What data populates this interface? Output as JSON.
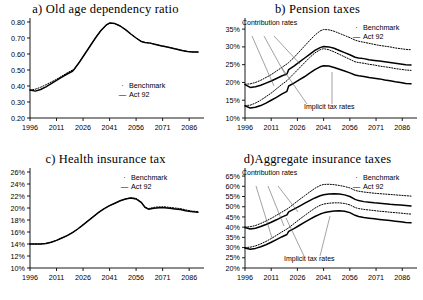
{
  "figure": {
    "panels": [
      {
        "key": "a",
        "title": "a) Old age dependency ratio",
        "legend": [
          {
            "marker": "·",
            "label": "Benchmark"
          },
          {
            "marker": "—",
            "label": "Act 92"
          }
        ],
        "annotations": [],
        "chart_data": {
          "type": "line",
          "title": "a) Old age dependency ratio",
          "xlabel": "",
          "ylabel": "",
          "xlim": [
            1996,
            2091
          ],
          "ylim": [
            0.2,
            0.8
          ],
          "yticks": [
            "0.20",
            "0.30",
            "0.40",
            "0.50",
            "0.60",
            "0.70",
            "0.80"
          ],
          "xticks": [
            "1996",
            "2011",
            "2026",
            "2041",
            "2056",
            "2071",
            "2086"
          ],
          "grid": false,
          "legend_position": "inside-right",
          "x": [
            1996,
            1999,
            2002,
            2005,
            2008,
            2011,
            2014,
            2017,
            2020,
            2021,
            2024,
            2027,
            2030,
            2033,
            2036,
            2039,
            2041,
            2044,
            2047,
            2050,
            2053,
            2056,
            2059,
            2061,
            2064,
            2067,
            2070,
            2073,
            2076,
            2079,
            2082,
            2085,
            2088,
            2091
          ],
          "series": [
            {
              "name": "Benchmark",
              "style": "dotted",
              "values": [
                0.375,
                0.38,
                0.392,
                0.408,
                0.425,
                0.442,
                0.462,
                0.482,
                0.5,
                0.505,
                0.55,
                0.6,
                0.65,
                0.7,
                0.745,
                0.78,
                0.793,
                0.79,
                0.775,
                0.752,
                0.725,
                0.7,
                0.678,
                0.672,
                0.668,
                0.66,
                0.652,
                0.645,
                0.638,
                0.63,
                0.622,
                0.616,
                0.613,
                0.612
              ]
            },
            {
              "name": "Act 92",
              "style": "solid",
              "values": [
                0.375,
                0.368,
                0.378,
                0.395,
                0.415,
                0.435,
                0.455,
                0.475,
                0.492,
                0.505,
                0.55,
                0.6,
                0.65,
                0.7,
                0.745,
                0.78,
                0.793,
                0.79,
                0.775,
                0.752,
                0.725,
                0.7,
                0.678,
                0.672,
                0.668,
                0.66,
                0.652,
                0.645,
                0.638,
                0.63,
                0.622,
                0.616,
                0.613,
                0.612
              ]
            }
          ]
        }
      },
      {
        "key": "b",
        "title": "b) Pension taxes",
        "legend": [
          {
            "marker": "·",
            "label": "Benchmark"
          },
          {
            "marker": "—",
            "label": "Act 92"
          }
        ],
        "annotations": [
          "Contribution rates",
          "Implicit tax rates"
        ],
        "chart_data": {
          "type": "line",
          "title": "b) Pension taxes",
          "xlabel": "",
          "ylabel": "",
          "xlim": [
            1996,
            2091
          ],
          "ylim": [
            10,
            37
          ],
          "yticks": [
            "10%",
            "15%",
            "20%",
            "25%",
            "30%",
            "35%"
          ],
          "xticks": [
            "1996",
            "2011",
            "2026",
            "2041",
            "2056",
            "2071",
            "2086"
          ],
          "grid": false,
          "legend_position": "top-right",
          "x": [
            1996,
            1999,
            2002,
            2005,
            2008,
            2011,
            2014,
            2017,
            2020,
            2021,
            2024,
            2027,
            2030,
            2033,
            2036,
            2039,
            2041,
            2044,
            2047,
            2050,
            2053,
            2056,
            2059,
            2061,
            2064,
            2067,
            2070,
            2073,
            2076,
            2079,
            2082,
            2085,
            2088,
            2091
          ],
          "series": [
            {
              "name": "Contribution rates - Benchmark",
              "style": "dotted",
              "group": "contribution",
              "values": [
                19.5,
                19.6,
                20.0,
                20.6,
                21.4,
                22.2,
                23.2,
                24.2,
                25.2,
                25.6,
                27.0,
                28.6,
                30.2,
                31.8,
                33.3,
                34.5,
                34.9,
                34.8,
                34.4,
                33.8,
                33.2,
                32.6,
                31.9,
                31.6,
                31.3,
                31.0,
                30.7,
                30.4,
                30.2,
                30.0,
                29.7,
                29.5,
                29.3,
                29.2
              ]
            },
            {
              "name": "Contribution rates - Act 92",
              "style": "solid",
              "group": "contribution",
              "values": [
                19.4,
                18.6,
                18.8,
                19.2,
                19.8,
                20.4,
                21.1,
                21.8,
                22.4,
                23.6,
                24.6,
                25.7,
                26.8,
                27.9,
                29.0,
                29.8,
                30.1,
                30.0,
                29.6,
                29.0,
                28.4,
                27.8,
                27.1,
                26.9,
                26.7,
                26.4,
                26.2,
                26.0,
                25.8,
                25.6,
                25.4,
                25.2,
                25.0,
                24.9
              ]
            },
            {
              "name": "Implicit tax rates - Benchmark",
              "style": "dotted",
              "group": "implicit",
              "values": [
                13.5,
                13.6,
                14.2,
                15.0,
                16.0,
                17.0,
                18.2,
                19.4,
                20.5,
                21.0,
                22.5,
                24.0,
                25.5,
                27.0,
                28.3,
                29.2,
                29.5,
                29.2,
                28.6,
                27.9,
                27.2,
                26.5,
                25.8,
                25.6,
                25.4,
                25.1,
                24.9,
                24.6,
                24.4,
                24.2,
                23.9,
                23.7,
                23.5,
                23.4
              ]
            },
            {
              "name": "Implicit tax rates - Act 92",
              "style": "solid",
              "group": "implicit",
              "values": [
                13.4,
                12.8,
                13.0,
                13.5,
                14.2,
                15.0,
                15.8,
                16.7,
                17.5,
                19.0,
                19.8,
                20.7,
                21.6,
                22.6,
                23.6,
                24.4,
                24.7,
                24.6,
                24.2,
                23.7,
                23.2,
                22.7,
                22.1,
                21.9,
                21.7,
                21.4,
                21.2,
                21.0,
                20.7,
                20.5,
                20.2,
                20.0,
                19.7,
                19.6
              ]
            }
          ]
        }
      },
      {
        "key": "c",
        "title": "c) Health insurance tax",
        "legend": [
          {
            "marker": "·",
            "label": "Benchmark"
          },
          {
            "marker": "—",
            "label": "Act 92"
          }
        ],
        "annotations": [],
        "chart_data": {
          "type": "line",
          "title": "c) Health insurance tax",
          "xlabel": "",
          "ylabel": "",
          "xlim": [
            1996,
            2091
          ],
          "ylim": [
            10,
            26
          ],
          "yticks": [
            "10%",
            "12%",
            "14%",
            "16%",
            "18%",
            "20%",
            "22%",
            "24%",
            "26%"
          ],
          "xticks": [
            "1996",
            "2011",
            "2026",
            "2041",
            "2056",
            "2071",
            "2086"
          ],
          "grid": false,
          "legend_position": "top-right",
          "x": [
            1996,
            1999,
            2002,
            2005,
            2008,
            2011,
            2014,
            2017,
            2020,
            2023,
            2026,
            2029,
            2032,
            2035,
            2038,
            2041,
            2044,
            2047,
            2050,
            2053,
            2056,
            2059,
            2061,
            2063,
            2066,
            2069,
            2072,
            2075,
            2078,
            2081,
            2084,
            2087,
            2091
          ],
          "series": [
            {
              "name": "Benchmark",
              "style": "dotted",
              "values": [
                14.0,
                14.0,
                14.0,
                14.1,
                14.3,
                14.6,
                15.0,
                15.4,
                15.9,
                16.5,
                17.2,
                17.9,
                18.6,
                19.3,
                19.9,
                20.4,
                20.8,
                21.2,
                21.5,
                21.7,
                21.6,
                21.0,
                20.2,
                19.9,
                20.1,
                20.2,
                20.2,
                20.1,
                20.0,
                19.9,
                19.7,
                19.5,
                19.4
              ]
            },
            {
              "name": "Act 92",
              "style": "solid",
              "values": [
                14.0,
                14.0,
                14.0,
                14.1,
                14.3,
                14.6,
                15.0,
                15.4,
                15.9,
                16.5,
                17.2,
                17.9,
                18.6,
                19.3,
                19.9,
                20.4,
                20.8,
                21.2,
                21.5,
                21.65,
                21.5,
                20.9,
                20.1,
                19.8,
                19.95,
                20.05,
                20.05,
                19.95,
                19.85,
                19.75,
                19.55,
                19.4,
                19.3
              ]
            }
          ]
        }
      },
      {
        "key": "d",
        "title": "d)Aggregate insurance taxes",
        "legend": [
          {
            "marker": "·",
            "label": "Benchmark"
          },
          {
            "marker": "—",
            "label": "Act 92"
          }
        ],
        "annotations": [
          "Contribution rates",
          "Implicit tax rates"
        ],
        "chart_data": {
          "type": "line",
          "title": "d)Aggregate insurance taxes",
          "xlabel": "",
          "ylabel": "",
          "xlim": [
            1996,
            2091
          ],
          "ylim": [
            20,
            67
          ],
          "yticks": [
            "20%",
            "25%",
            "30%",
            "35%",
            "40%",
            "45%",
            "50%",
            "55%",
            "60%",
            "65%"
          ],
          "xticks": [
            "1996",
            "2011",
            "2026",
            "2041",
            "2056",
            "2071",
            "2086"
          ],
          "grid": false,
          "legend_position": "top-right",
          "x": [
            1996,
            1999,
            2002,
            2005,
            2008,
            2011,
            2014,
            2017,
            2020,
            2021,
            2024,
            2027,
            2030,
            2033,
            2036,
            2039,
            2041,
            2044,
            2047,
            2050,
            2053,
            2056,
            2059,
            2061,
            2064,
            2067,
            2070,
            2073,
            2076,
            2079,
            2082,
            2085,
            2088,
            2091
          ],
          "series": [
            {
              "name": "Contribution rates - Benchmark",
              "style": "dotted",
              "group": "contribution",
              "values": [
                40.0,
                40.2,
                40.8,
                41.8,
                43.0,
                44.3,
                45.8,
                47.3,
                48.8,
                49.4,
                51.4,
                53.4,
                55.3,
                57.2,
                59.0,
                60.4,
                60.9,
                61.0,
                60.8,
                60.4,
                59.9,
                59.2,
                58.0,
                57.6,
                57.2,
                56.9,
                56.6,
                56.4,
                56.2,
                56.0,
                55.8,
                55.6,
                55.4,
                55.2
              ]
            },
            {
              "name": "Contribution rates - Act 92",
              "style": "solid",
              "group": "contribution",
              "values": [
                39.8,
                39.1,
                39.5,
                40.3,
                41.3,
                42.4,
                43.6,
                44.9,
                46.0,
                47.5,
                48.8,
                50.2,
                51.6,
                53.0,
                54.3,
                55.4,
                55.9,
                56.2,
                56.3,
                56.2,
                55.8,
                55.0,
                53.6,
                53.0,
                52.5,
                52.2,
                51.9,
                51.7,
                51.5,
                51.2,
                51.0,
                50.8,
                50.6,
                50.4
              ]
            },
            {
              "name": "Implicit tax rates - Benchmark",
              "style": "dotted",
              "group": "implicit",
              "values": [
                30.0,
                30.2,
                30.8,
                31.8,
                33.0,
                34.4,
                36.0,
                37.6,
                39.1,
                39.7,
                41.7,
                43.7,
                45.6,
                47.5,
                49.3,
                50.7,
                51.3,
                51.7,
                51.9,
                51.9,
                51.6,
                50.9,
                49.6,
                49.1,
                48.7,
                48.4,
                48.1,
                47.8,
                47.6,
                47.3,
                47.1,
                46.9,
                46.6,
                46.4
              ]
            },
            {
              "name": "Implicit tax rates - Act 92",
              "style": "solid",
              "group": "implicit",
              "values": [
                29.8,
                29.2,
                29.6,
                30.4,
                31.4,
                32.6,
                33.9,
                35.2,
                36.4,
                37.9,
                39.3,
                40.8,
                42.3,
                43.8,
                45.2,
                46.4,
                47.0,
                47.5,
                47.9,
                48.0,
                47.8,
                47.1,
                45.8,
                45.2,
                44.7,
                44.4,
                44.1,
                43.8,
                43.5,
                43.2,
                42.9,
                42.6,
                42.3,
                42.1
              ]
            }
          ]
        }
      }
    ]
  }
}
